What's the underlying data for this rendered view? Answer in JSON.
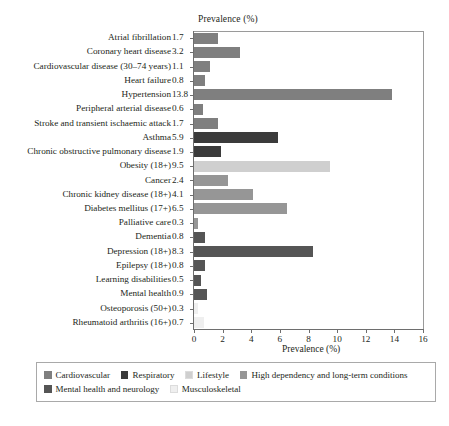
{
  "chart_data": {
    "type": "bar",
    "orientation": "horizontal",
    "title": "",
    "xlabel": "Prevalence (%)",
    "xlabel_top": "Prevalence (%)",
    "ylabel": "",
    "xlim": [
      0,
      16
    ],
    "xticks": [
      0,
      2,
      4,
      6,
      8,
      10,
      12,
      14,
      16
    ],
    "xtick_labels": [
      "0",
      "2",
      "4",
      "6",
      "8",
      "10",
      "12",
      "14",
      "16"
    ],
    "grid": false,
    "legend_position": "bottom",
    "categories": [
      "Atrial fibrillation",
      "Coronary heart disease",
      "Cardiovascular disease (30–74 years)",
      "Heart failure",
      "Hypertension",
      "Peripheral arterial disease",
      "Stroke and transient ischaemic attack",
      "Asthma",
      "Chronic obstructive pulmonary disease",
      "Obesity (18+)",
      "Cancer",
      "Chronic kidney disease (18+)",
      "Diabetes mellitus (17+)",
      "Palliative care",
      "Dementia",
      "Depression (18+)",
      "Epilepsy (18+)",
      "Learning disabilities",
      "Mental health",
      "Osteoporosis (50+)",
      "Rheumatoid arthritis (16+)"
    ],
    "values": [
      1.7,
      3.2,
      1.1,
      0.8,
      13.8,
      0.6,
      1.7,
      5.9,
      1.9,
      9.5,
      2.4,
      4.1,
      6.5,
      0.3,
      0.8,
      8.3,
      0.8,
      0.5,
      0.9,
      0.3,
      0.7
    ],
    "value_labels": [
      "1.7",
      "3.2",
      "1.1",
      "0.8",
      "13.8",
      "0.6",
      "1.7",
      "5.9",
      "1.9",
      "9.5",
      "2.4",
      "4.1",
      "6.5",
      "0.3",
      "0.8",
      "8.3",
      "0.8",
      "0.5",
      "0.9",
      "0.3",
      "0.7"
    ],
    "groups": [
      "Cardiovascular",
      "Cardiovascular",
      "Cardiovascular",
      "Cardiovascular",
      "Cardiovascular",
      "Cardiovascular",
      "Cardiovascular",
      "Respiratory",
      "Respiratory",
      "Lifestyle",
      "High dependency and long-term conditions",
      "High dependency and long-term conditions",
      "High dependency and long-term conditions",
      "High dependency and long-term conditions",
      "Mental health and neurology",
      "Mental health and neurology",
      "Mental health and neurology",
      "Mental health and neurology",
      "Mental health and neurology",
      "Musculoskeletal",
      "Musculoskeletal"
    ],
    "legend": [
      {
        "label": "Cardiovascular",
        "color": "#7f7f7f"
      },
      {
        "label": "Respiratory",
        "color": "#3b3b3b"
      },
      {
        "label": "Lifestyle",
        "color": "#cfcfcf"
      },
      {
        "label": "High dependency and long-term conditions",
        "color": "#969696"
      },
      {
        "label": "Mental health and neurology",
        "color": "#555555"
      },
      {
        "label": "Musculoskeletal",
        "color": "#efefef"
      }
    ],
    "colors": {
      "Cardiovascular": "#7f7f7f",
      "Respiratory": "#3b3b3b",
      "Lifestyle": "#cfcfcf",
      "High dependency and long-term conditions": "#969696",
      "Mental health and neurology": "#555555",
      "Musculoskeletal": "#efefef"
    }
  }
}
